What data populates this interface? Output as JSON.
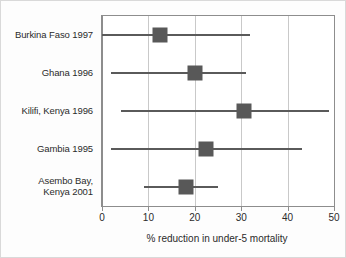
{
  "chart_data": {
    "type": "scatter",
    "title": "",
    "xlabel": "% reduction in under-5 mortality",
    "ylabel": "",
    "xlim": [
      0,
      50
    ],
    "xticks": [
      0,
      10,
      20,
      30,
      40,
      50
    ],
    "xticklabels": [
      "0",
      "10",
      "20",
      "30",
      "40",
      "50"
    ],
    "grid": true,
    "legend": "none",
    "marker_color": "#585858",
    "line_color": "#5a5a5a",
    "categories": [
      "Burkina Faso 1997",
      "Ghana 1996",
      "Kilifi, Kenya 1996",
      "Gambia 1995",
      "Asembo Bay, Kenya 2001"
    ],
    "points": [
      {
        "label": "Burkina Faso 1997",
        "label_lines": [
          "Burkina Faso 1997"
        ],
        "value": 12.5,
        "ci_low": 0,
        "ci_high": 32
      },
      {
        "label": "Ghana 1996",
        "label_lines": [
          "Ghana 1996"
        ],
        "value": 20,
        "ci_low": 2,
        "ci_high": 31
      },
      {
        "label": "Kilifi, Kenya 1996",
        "label_lines": [
          "Kilifi, Kenya 1996"
        ],
        "value": 30.5,
        "ci_low": 4,
        "ci_high": 49
      },
      {
        "label": "Gambia 1995",
        "label_lines": [
          "Gambia 1995"
        ],
        "value": 22.5,
        "ci_low": 2,
        "ci_high": 43
      },
      {
        "label": "Asembo Bay, Kenya 2001",
        "label_lines": [
          "Asembo Bay,",
          "Kenya 2001"
        ],
        "value": 18,
        "ci_low": 9,
        "ci_high": 25
      }
    ]
  }
}
